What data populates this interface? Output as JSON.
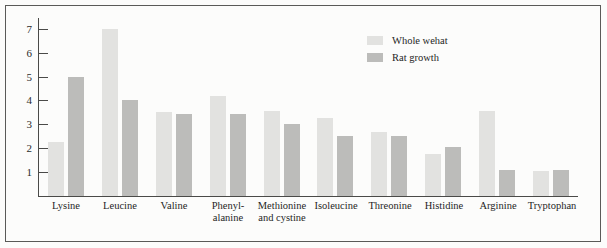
{
  "chart_data": {
    "type": "bar",
    "title": "",
    "xlabel": "",
    "ylabel": "",
    "ylim": [
      0,
      7.45
    ],
    "grid": false,
    "legend_position": "top-right",
    "y_ticks": [
      1,
      2,
      3,
      4,
      5,
      6,
      7
    ],
    "y_tick_labels": [
      "1",
      "2",
      "3",
      "4",
      "5",
      "6",
      "7"
    ],
    "categories": [
      "Lysine",
      "Leucine",
      "Valine",
      "Phenyl-\nalanine",
      "Methionine\nand cystine",
      "Isoleucine",
      "Threonine",
      "Histidine",
      "Arginine",
      "Tryptophan"
    ],
    "series": [
      {
        "name": "Whole wehat",
        "color": "#e2e2e0",
        "values": [
          2.25,
          7.0,
          3.5,
          4.2,
          3.55,
          3.25,
          2.7,
          1.75,
          3.55,
          1.05
        ]
      },
      {
        "name": "Rat growth",
        "color": "#bcbcba",
        "values": [
          5.0,
          4.0,
          3.45,
          3.45,
          3.0,
          2.5,
          2.5,
          2.05,
          1.1,
          1.1
        ]
      }
    ]
  },
  "legend": {
    "items": [
      {
        "label": "Whole wehat",
        "swatch": "light"
      },
      {
        "label": "Rat growth",
        "swatch": "dark"
      }
    ]
  }
}
